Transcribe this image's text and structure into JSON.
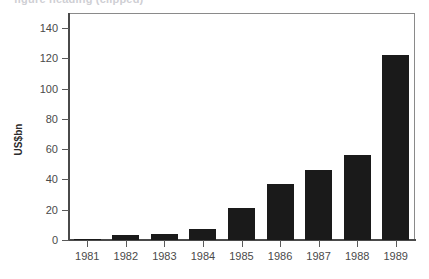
{
  "top_clipped_text": "figure heading (clipped)",
  "chart_data": {
    "type": "bar",
    "title": "",
    "subtitle": "",
    "xlabel": "",
    "ylabel": "US$bn",
    "categories": [
      "1981",
      "1982",
      "1983",
      "1984",
      "1985",
      "1986",
      "1987",
      "1988",
      "1989"
    ],
    "values": [
      1,
      3,
      4,
      7.5,
      21,
      37,
      46,
      56,
      122
    ],
    "ylim": [
      0,
      150
    ],
    "yticks": [
      0,
      20,
      40,
      60,
      80,
      100,
      120,
      140
    ],
    "ytick_labels": [
      "0",
      "20",
      "40",
      "60",
      "80",
      "100",
      "120",
      "140"
    ],
    "grid": false,
    "legend": false,
    "legend_position": "none",
    "series": [
      {
        "name": "US$bn",
        "color": "#1a1a1a",
        "values": [
          1,
          3,
          4,
          7.5,
          21,
          37,
          46,
          56,
          122
        ]
      }
    ]
  },
  "colors": {
    "bar": "#1a1a1a",
    "axis": "#4a4a4a",
    "frame": "#8a8a8a",
    "tick_text": "#4a4a4a",
    "background": "#ffffff"
  }
}
